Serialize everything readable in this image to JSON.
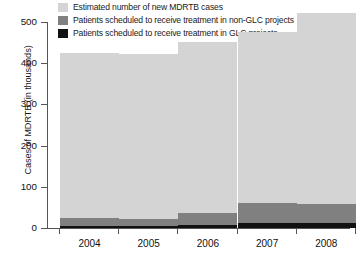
{
  "chart_data": {
    "type": "bar",
    "subtype": "stacked",
    "title": "",
    "xlabel": "",
    "ylabel": "Cases of MDRTB (in thousands)",
    "ylim": [
      0,
      500
    ],
    "yticks": [
      0,
      100,
      200,
      300,
      400,
      500
    ],
    "ytick_labels": [
      "0",
      "100",
      "200",
      "300",
      "400",
      "500"
    ],
    "grid": false,
    "legend_position": "top",
    "categories": [
      "2004",
      "2005",
      "2006",
      "2007",
      "2008"
    ],
    "series": [
      {
        "name": "Estimated number of new MDRTB cases",
        "color": "#d4d4d4",
        "values": [
          400,
          400,
          415,
          415,
          465
        ]
      },
      {
        "name": "Patients scheduled to receive treatment in non-GLC projects",
        "color": "#808080",
        "values": [
          20,
          18,
          30,
          50,
          45
        ]
      },
      {
        "name": "Patients scheduled to receive treatment in GLC projects",
        "color": "#111111",
        "values": [
          5,
          5,
          7,
          11,
          13
        ]
      }
    ]
  },
  "legend": {
    "items": [
      {
        "label": "Estimated number of new MDRTB cases",
        "color": "#d4d4d4"
      },
      {
        "label": "Patients scheduled to receive treatment in non-GLC projects",
        "color": "#808080"
      },
      {
        "label": "Patients scheduled to receive treatment in GLC projects",
        "color": "#111111"
      }
    ]
  },
  "axes": {
    "y_title": "Cases of MDRTB (in thousands)",
    "y_ticks": [
      "0",
      "100",
      "200",
      "300",
      "400",
      "500"
    ],
    "x_ticks": [
      "2004",
      "2005",
      "2006",
      "2007",
      "2008"
    ]
  }
}
